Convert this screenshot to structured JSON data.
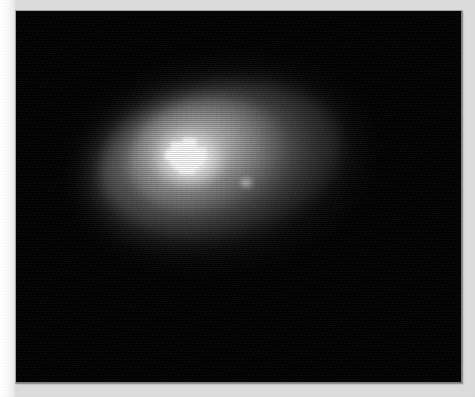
{
  "figure": {
    "domain": "Chart",
    "kind": "grayscale-intensity-image",
    "plate": {
      "background_color": "#000000",
      "page_color": "#ffffff",
      "border_color": "#9a9a9a",
      "left_px": 16,
      "top_px": 11,
      "width_px": 446,
      "height_px": 372
    },
    "visible_text": [],
    "labels": [],
    "axis_ticks": [],
    "legend_entries": []
  },
  "chart_data": {
    "type": "heatmap",
    "title": "",
    "subtitle": "",
    "xlabel": "",
    "ylabel": "",
    "colormap": "grayscale",
    "colormap_low": "#000000",
    "colormap_high": "#ffffff",
    "grid": false,
    "legend": "none",
    "xlim": [
      0,
      446
    ],
    "ylim": [
      0,
      372
    ],
    "xtick_labels": [],
    "ytick_labels": [],
    "intensity_scale": {
      "min": 0,
      "max": 255,
      "background_level": 0,
      "peak_level": 255
    },
    "features": [
      {
        "name": "outer-envelope",
        "shape": "ellipse",
        "center_x": 190,
        "center_y": 141,
        "semi_major": 144,
        "semi_minor": 96,
        "position_angle_deg": -9,
        "peak_intensity": 60
      },
      {
        "name": "main-body",
        "shape": "ellipse",
        "center_x": 189,
        "center_y": 137,
        "semi_major": 123,
        "semi_minor": 76,
        "position_angle_deg": -10,
        "peak_intensity": 115
      },
      {
        "name": "inner-bulge",
        "shape": "ellipse",
        "center_x": 174,
        "center_y": 133,
        "semi_major": 78,
        "semi_minor": 56,
        "position_angle_deg": -12,
        "peak_intensity": 185
      },
      {
        "name": "nucleus",
        "shape": "ellipse",
        "center_x": 173,
        "center_y": 147,
        "semi_major": 37,
        "semi_minor": 29,
        "position_angle_deg": 0,
        "peak_intensity": 255
      },
      {
        "name": "secondary-knot",
        "shape": "ellipse",
        "center_x": 230,
        "center_y": 171,
        "semi_major": 8,
        "semi_minor": 7,
        "position_angle_deg": 0,
        "peak_intensity": 150
      },
      {
        "name": "lower-left-spur",
        "shape": "ellipse",
        "center_x": 165,
        "center_y": 190,
        "semi_major": 75,
        "semi_minor": 40,
        "position_angle_deg": -4,
        "peak_intensity": 80
      }
    ],
    "saturated_core_blocks": [
      {
        "x": 6,
        "y": 4,
        "w": 12,
        "h": 7
      },
      {
        "x": 18,
        "y": 0,
        "w": 13,
        "h": 11
      },
      {
        "x": 3,
        "y": 11,
        "w": 28,
        "h": 8
      },
      {
        "x": 0,
        "y": 13,
        "w": 36,
        "h": 9
      },
      {
        "x": 5,
        "y": 19,
        "w": 33,
        "h": 8
      },
      {
        "x": 9,
        "y": 25,
        "w": 25,
        "h": 7
      },
      {
        "x": 31,
        "y": 10,
        "w": 10,
        "h": 12
      },
      {
        "x": 14,
        "y": 30,
        "w": 16,
        "h": 6
      }
    ],
    "render_artifacts": {
      "halftone_scanlines": true,
      "pixel_rebinning": true,
      "film_grain": true
    }
  }
}
